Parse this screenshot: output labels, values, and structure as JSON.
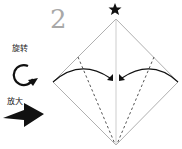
{
  "step": {
    "number": "2"
  },
  "legend": {
    "rotate_label": "旋转",
    "rotate_icon": "rotate-clockwise-icon",
    "zoom_label": "放大",
    "zoom_icon": "arrow-right-icon"
  },
  "diagram": {
    "star_icon": "star-icon",
    "shape": "diamond-square",
    "colors": {
      "outline": "#b0b0b0",
      "fold": "#555555",
      "arrow": "#111111"
    }
  }
}
